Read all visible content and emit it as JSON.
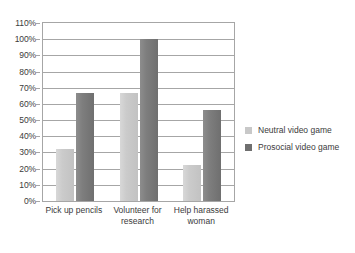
{
  "chart_data": {
    "type": "bar",
    "title": "",
    "subtitle": "",
    "xlabel": "",
    "ylabel": "",
    "ylim": [
      0,
      110
    ],
    "ytick_step": 10,
    "ytick_labels": [
      "0%",
      "10%",
      "20%",
      "30%",
      "40%",
      "50%",
      "60%",
      "70%",
      "80%",
      "90%",
      "100%",
      "110%"
    ],
    "grid": true,
    "legend_position": "right",
    "categories": [
      "Pick up pencils",
      "Volunteer for research",
      "Help harassed woman"
    ],
    "category_lines": [
      [
        "Pick up pencils"
      ],
      [
        "Volunteer for",
        "research"
      ],
      [
        "Help harassed",
        "woman"
      ]
    ],
    "series": [
      {
        "name": "Neutral video game",
        "color": "#c8c8c8",
        "values": [
          32,
          67,
          22
        ]
      },
      {
        "name": "Prosocial video game",
        "color": "#6f6f6f",
        "values": [
          67,
          100,
          56
        ]
      }
    ]
  },
  "colors": {
    "axis": "#a6a6a6",
    "text": "#3b3b3b",
    "plot_background": "#ffffff",
    "neutral_series": "#c8c8c8",
    "prosocial_series": "#6f6f6f"
  }
}
